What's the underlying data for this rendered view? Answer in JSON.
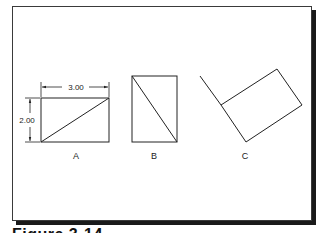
{
  "figure": {
    "caption": "Figure 3-14",
    "dimensions": {
      "width_label": "3.00",
      "height_label": "2.00"
    },
    "views": [
      {
        "label": "A",
        "description": "rectangle with diagonal from lower-left to upper-right, dimensioned 3.00 x 2.00"
      },
      {
        "label": "B",
        "description": "rectangle rotated 90 degrees with diagonal from upper-left to lower-right"
      },
      {
        "label": "C",
        "description": "rectangle rotated with an extension line from upper-left corner"
      }
    ],
    "colors": {
      "line": "#222222",
      "shadow": "#1a1a1a",
      "background": "#ffffff"
    }
  }
}
